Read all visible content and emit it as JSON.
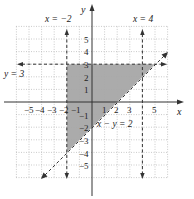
{
  "graph": {
    "x_axis_label": "x",
    "y_axis_label": "y",
    "x_tick_labels": [
      "−5",
      "−4",
      "−3",
      "−2",
      "−1",
      "1",
      "2",
      "3",
      "5"
    ],
    "x_tick_values": [
      -5,
      -4,
      -3,
      -2,
      -1,
      1,
      2,
      3,
      5
    ],
    "y_tick_labels": [
      "5",
      "4",
      "3",
      "2",
      "1",
      "−1",
      "−2",
      "−3",
      "−4",
      "−5"
    ],
    "y_tick_values": [
      5,
      4,
      3,
      2,
      1,
      -1,
      -2,
      -3,
      -4,
      -5
    ],
    "range": {
      "x": [
        -6,
        6
      ],
      "y": [
        -6,
        6
      ]
    },
    "grid": "dotted",
    "boundary_lines": [
      {
        "label": "x = −2",
        "type": "vertical",
        "value": -2,
        "style": "dashed"
      },
      {
        "label": "x = 4",
        "type": "vertical",
        "value": 4,
        "style": "dashed"
      },
      {
        "label": "y = 3",
        "type": "horizontal",
        "value": 3,
        "style": "dashed"
      },
      {
        "label": "x − y = 2",
        "type": "line",
        "slope": 1,
        "intercept": -2,
        "style": "dashed"
      }
    ],
    "shaded_region": {
      "vertices": [
        [
          -2,
          3
        ],
        [
          5,
          3
        ],
        [
          -2,
          -4
        ]
      ],
      "color": "#a6a6a6"
    },
    "colors": {
      "shade": "#a6a6a6",
      "axis": "#333333",
      "grid": "#bdbdbd",
      "line": "#333333"
    }
  }
}
